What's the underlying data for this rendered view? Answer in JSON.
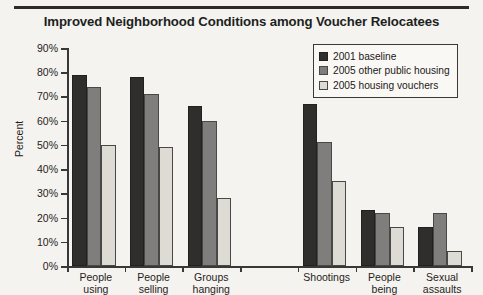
{
  "chart_data": {
    "type": "bar",
    "title": "Improved Neighborhood Conditions among Voucher Relocatees",
    "xlabel": "",
    "ylabel": "Percent",
    "ylim": [
      0,
      90
    ],
    "ytick_step": 10,
    "ytick_labels": [
      "0%",
      "10%",
      "20%",
      "30%",
      "40%",
      "50%",
      "60%",
      "70%",
      "80%",
      "90%"
    ],
    "grid": false,
    "legend_position": "top-right",
    "categories": [
      "People using",
      "People selling",
      "Groups hanging",
      "",
      "Shootings",
      "People being",
      "Sexual assaults"
    ],
    "series": [
      {
        "name": "2001 baseline",
        "color": "#302e2c",
        "values": [
          79,
          78,
          66,
          null,
          67,
          23,
          16
        ]
      },
      {
        "name": "2005 other public housing",
        "color": "#807e7c",
        "values": [
          74,
          71,
          60,
          null,
          51,
          22,
          22
        ]
      },
      {
        "name": "2005 housing vouchers",
        "color": "#dedad4",
        "values": [
          50,
          49,
          28,
          null,
          35,
          16,
          6
        ]
      }
    ]
  },
  "legend": {
    "items": [
      {
        "label": "2001 baseline"
      },
      {
        "label": "2005 other public housing"
      },
      {
        "label": "2005 housing vouchers"
      }
    ]
  },
  "axis": {
    "y_title": "Percent"
  }
}
